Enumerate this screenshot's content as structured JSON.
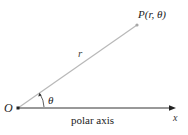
{
  "diagram": {
    "origin": {
      "label": "O",
      "x": 18,
      "y": 108
    },
    "point": {
      "label": "P(r, θ)",
      "x": 137,
      "y": 25
    },
    "radius": {
      "label": "r"
    },
    "angle": {
      "label": "θ"
    },
    "axis": {
      "label": "polar axis",
      "end_label": "x"
    },
    "colors": {
      "ray": "#b8b8b8",
      "axis": "#333333",
      "text": "#222222",
      "point": "#a8a8a8"
    }
  }
}
